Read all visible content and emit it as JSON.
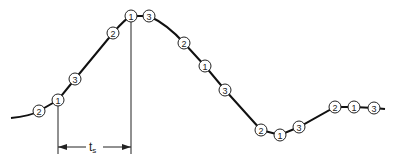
{
  "diagram": {
    "nodes": [
      {
        "label": "2",
        "x": 39,
        "y": 111
      },
      {
        "label": "1",
        "x": 58,
        "y": 100
      },
      {
        "label": "3",
        "x": 75,
        "y": 79
      },
      {
        "label": "2",
        "x": 113,
        "y": 33
      },
      {
        "label": "1",
        "x": 131,
        "y": 16
      },
      {
        "label": "3",
        "x": 149,
        "y": 16
      },
      {
        "label": "2",
        "x": 184,
        "y": 43
      },
      {
        "label": "1",
        "x": 205,
        "y": 66
      },
      {
        "label": "3",
        "x": 225,
        "y": 90
      },
      {
        "label": "2",
        "x": 261,
        "y": 130
      },
      {
        "label": "1",
        "x": 280,
        "y": 135
      },
      {
        "label": "3",
        "x": 299,
        "y": 127
      },
      {
        "label": "2",
        "x": 335,
        "y": 107
      },
      {
        "label": "1",
        "x": 354,
        "y": 107
      },
      {
        "label": "3",
        "x": 374,
        "y": 108
      }
    ],
    "interval_label": "t",
    "interval_subscript": "s"
  }
}
